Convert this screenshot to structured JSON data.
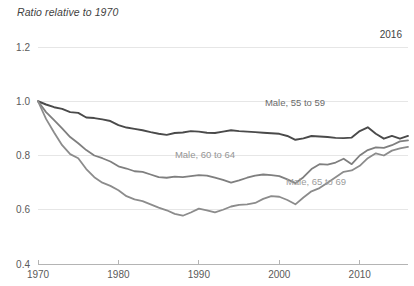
{
  "chart_data": {
    "type": "line",
    "title": "Ratio relative to 1970",
    "xlabel": "",
    "ylabel": "",
    "annotation": "2016",
    "xlim": [
      1970,
      2016
    ],
    "ylim": [
      0.4,
      1.2
    ],
    "grid": true,
    "legend_position": "inline",
    "ytick_labels": [
      "0.4",
      "0.6",
      "0.8",
      "1.0",
      "1.2"
    ],
    "ytick_values": [
      0.4,
      0.6,
      0.8,
      1.0,
      1.2
    ],
    "xtick_labels": [
      "1970",
      "1980",
      "1990",
      "2000",
      "2010"
    ],
    "xtick_values": [
      1970,
      1980,
      1990,
      2000,
      2010
    ],
    "x": [
      1970,
      1971,
      1972,
      1973,
      1974,
      1975,
      1976,
      1977,
      1978,
      1979,
      1980,
      1981,
      1982,
      1983,
      1984,
      1985,
      1986,
      1987,
      1988,
      1989,
      1990,
      1991,
      1992,
      1993,
      1994,
      1995,
      1996,
      1997,
      1998,
      1999,
      2000,
      2001,
      2002,
      2003,
      2004,
      2005,
      2006,
      2007,
      2008,
      2009,
      2010,
      2011,
      2012,
      2013,
      2014,
      2015,
      2016
    ],
    "series": [
      {
        "name": "Male, 55 to 59",
        "color": "#4a4a4a",
        "label_color": "#6b6b6b",
        "values": [
          1.0,
          0.988,
          0.978,
          0.972,
          0.96,
          0.957,
          0.94,
          0.938,
          0.933,
          0.927,
          0.912,
          0.903,
          0.898,
          0.893,
          0.886,
          0.88,
          0.876,
          0.883,
          0.885,
          0.89,
          0.888,
          0.884,
          0.883,
          0.888,
          0.893,
          0.89,
          0.888,
          0.886,
          0.884,
          0.882,
          0.88,
          0.872,
          0.858,
          0.863,
          0.872,
          0.87,
          0.868,
          0.865,
          0.864,
          0.866,
          0.89,
          0.904,
          0.88,
          0.862,
          0.872,
          0.862,
          0.872
        ]
      },
      {
        "name": "Male, 60 to 64",
        "color": "#7f7f7f",
        "label_color": "#959595",
        "values": [
          1.0,
          0.96,
          0.93,
          0.9,
          0.868,
          0.845,
          0.82,
          0.8,
          0.79,
          0.778,
          0.76,
          0.752,
          0.742,
          0.74,
          0.73,
          0.72,
          0.718,
          0.722,
          0.72,
          0.724,
          0.728,
          0.726,
          0.718,
          0.71,
          0.7,
          0.708,
          0.718,
          0.726,
          0.73,
          0.728,
          0.724,
          0.712,
          0.698,
          0.72,
          0.75,
          0.768,
          0.766,
          0.774,
          0.788,
          0.768,
          0.8,
          0.82,
          0.83,
          0.828,
          0.838,
          0.852,
          0.856
        ]
      },
      {
        "name": "Male, 65 to 69",
        "color": "#8c8c8c",
        "label_color": "#9c9c9c",
        "values": [
          1.0,
          0.935,
          0.885,
          0.838,
          0.805,
          0.79,
          0.75,
          0.72,
          0.7,
          0.688,
          0.672,
          0.65,
          0.638,
          0.632,
          0.62,
          0.608,
          0.598,
          0.585,
          0.578,
          0.59,
          0.604,
          0.598,
          0.59,
          0.6,
          0.612,
          0.618,
          0.62,
          0.625,
          0.64,
          0.65,
          0.648,
          0.636,
          0.62,
          0.645,
          0.668,
          0.68,
          0.7,
          0.72,
          0.74,
          0.745,
          0.762,
          0.79,
          0.808,
          0.8,
          0.818,
          0.826,
          0.832
        ]
      }
    ]
  }
}
